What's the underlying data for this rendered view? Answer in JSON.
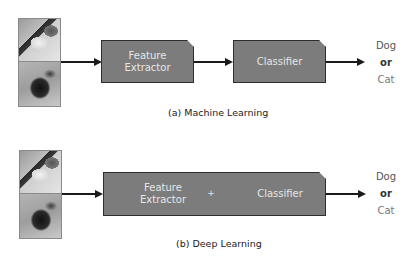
{
  "panels": [
    {
      "id": "machine-learning",
      "inputs": [
        {
          "label": "cat",
          "icon": "cat-photo"
        },
        {
          "label": "dog",
          "icon": "dog-photo"
        }
      ],
      "boxes": [
        {
          "line1": "Feature",
          "line2": "Extractor"
        },
        {
          "line1": "Classifier"
        }
      ],
      "outputs": {
        "dog": "Dog",
        "or": "or",
        "cat": "Cat"
      },
      "caption": "(a) Machine Learning"
    },
    {
      "id": "deep-learning",
      "inputs": [
        {
          "label": "cat",
          "icon": "cat-photo"
        },
        {
          "label": "dog",
          "icon": "dog-photo"
        }
      ],
      "box": {
        "left_line1": "Feature",
        "left_line2": "Extractor",
        "plus": "+",
        "right": "Classifier"
      },
      "outputs": {
        "dog": "Dog",
        "or": "or",
        "cat": "Cat"
      },
      "caption": "(b) Deep Learning"
    }
  ],
  "colors": {
    "box_fill": "#7c7c7c",
    "box_border": "#2e2e2e",
    "box_text": "#e6e6e6",
    "arrow": "#1a1a1a",
    "background": "#ffffff"
  }
}
